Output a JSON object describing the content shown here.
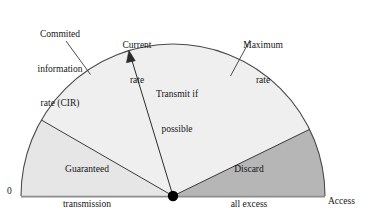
{
  "figure": {
    "type": "fan-diagram",
    "origin_label": "0",
    "regions": [
      {
        "id": "guaranteed",
        "label_line1": "Guaranteed",
        "label_line2": "transmission",
        "fill": "#e6e6e6",
        "start_angle_deg": 180,
        "end_angle_deg": 150
      },
      {
        "id": "transmit-if-possible",
        "label_line1": "Transmit if",
        "label_line2": "possible",
        "fill": "#efefef",
        "start_angle_deg": 150,
        "end_angle_deg": 26
      },
      {
        "id": "discard-all-excess",
        "label_line1": "Discard",
        "label_line2": "all excess",
        "fill": "#b6b6b6",
        "start_angle_deg": 26,
        "end_angle_deg": 0
      }
    ],
    "callouts": {
      "cir": {
        "line1": "Commited",
        "line2": "information",
        "line3": "rate (CIR)"
      },
      "current_rate": {
        "line1": "Current",
        "line2": "rate"
      },
      "maximum_rate": {
        "line1": "Maximum",
        "line2": "rate"
      },
      "access_rate": {
        "line1": "Access",
        "line2": "rate"
      }
    },
    "geometry": {
      "center_x": 173,
      "center_y": 196,
      "radius": 152,
      "cir_angle_deg": 150,
      "current_rate_angle_deg": 163,
      "maximum_rate_angle_deg": 26
    },
    "colors": {
      "stroke": "#3a3a3a",
      "baseline": "#8c8c8c",
      "pivot": "#000000",
      "text": "#151515",
      "background": "#ffffff"
    }
  }
}
